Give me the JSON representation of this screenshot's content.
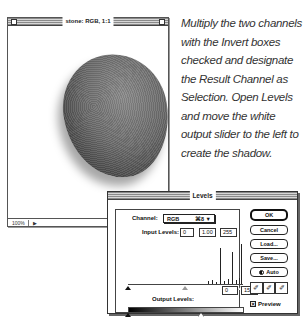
{
  "image_window": {
    "title": "stone: RGB, 1:1",
    "status": {
      "zoom": "100%",
      "doc_arrow": "▶"
    }
  },
  "caption": {
    "text": "Multiply the two channels with the Invert boxes checked and designate the Result Channel as Selection. Open Levels and move the white output slider to the left to create the shadow."
  },
  "levels_dialog": {
    "title": "Levels",
    "channel_label": "Channel:",
    "channel_value": "RGB",
    "channel_shortcut": "⌘8 ▼",
    "input_levels_label": "Input Levels:",
    "input_levels": [
      "0",
      "1.00",
      "255"
    ],
    "output_levels_label": "Output Levels:",
    "output_levels": [
      "0",
      "151"
    ],
    "buttons": {
      "ok": "OK",
      "cancel": "Cancel",
      "load": "Load...",
      "save": "Save...",
      "auto": "Auto"
    },
    "eyedroppers": [
      "✐",
      "✐",
      "✐"
    ],
    "preview_label": "Preview",
    "preview_checked": true,
    "preview_check_glyph": "☒",
    "cursor_glyph": "↖"
  }
}
